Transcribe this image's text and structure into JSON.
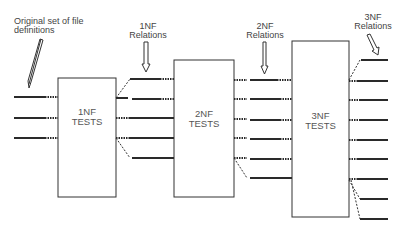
{
  "diagram": {
    "type": "normalization-flow",
    "annotations": {
      "original": "Original set of file definitions",
      "original_line1": "Original set of file",
      "original_line2": "definitions",
      "nf1_line1": "1NF",
      "nf1_line2": "Relations",
      "nf2_line1": "2NF",
      "nf2_line2": "Relations",
      "nf3_line1": "3NF",
      "nf3_line2": "Relations"
    },
    "boxes": [
      {
        "id": "1nf-tests",
        "line1": "1NF",
        "line2": "TESTS",
        "inputs": 3,
        "outputs": 5
      },
      {
        "id": "2nf-tests",
        "line1": "2NF",
        "line2": "TESTS",
        "inputs": 5,
        "outputs": 7
      },
      {
        "id": "3nf-tests",
        "line1": "3NF",
        "line2": "TESTS",
        "inputs": 7,
        "outputs": 9
      }
    ],
    "colors": {
      "stroke": "#333333",
      "background": "#ffffff"
    }
  }
}
